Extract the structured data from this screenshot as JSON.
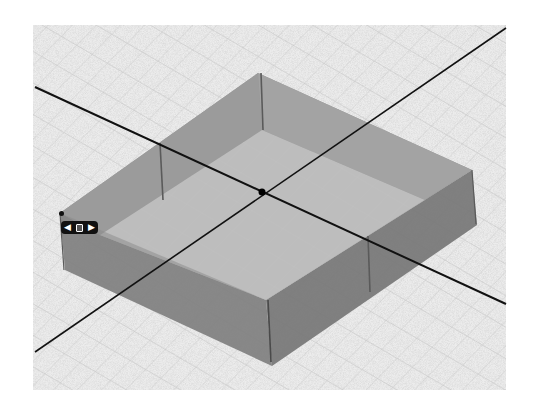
{
  "viewport": {
    "type": "3d-modeling-viewport",
    "background": "#e8e8e8",
    "grid_color": "#c4c4c4",
    "bounds": {
      "x": 33,
      "y": 25,
      "width": 473,
      "height": 365
    }
  },
  "model": {
    "name": "box",
    "rim_color": "#8a8a8a",
    "outer_wall_color": "#7d7d7d",
    "inner_wall_color": "#9a9a9a",
    "floor_color": "#bdbdbd",
    "edge_color": "#3a3a3a"
  },
  "axes": {
    "color": "#111111",
    "origin": {
      "x": 262,
      "y": 192
    }
  },
  "gizmo": {
    "left_icon": "arrow-left-icon",
    "center_icon": "move-handle-icon",
    "right_icon": "arrow-right-icon",
    "left_glyph": "◀",
    "right_glyph": "▶"
  }
}
